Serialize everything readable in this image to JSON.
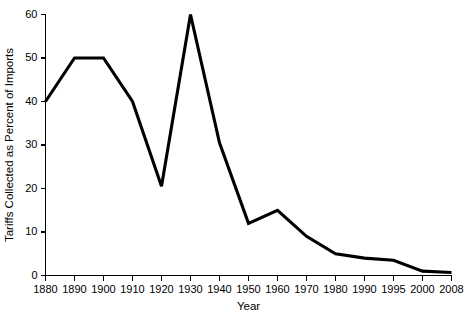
{
  "chart_data": {
    "type": "line",
    "title": "",
    "subtitle": "",
    "xlabel": "Year",
    "ylabel": "Tariffs Collected as Percent of Imports",
    "categories": [
      "1880",
      "1890",
      "1900",
      "1910",
      "1920",
      "1930",
      "1940",
      "1950",
      "1960",
      "1970",
      "1980",
      "1990",
      "1995",
      "2000",
      "2008"
    ],
    "values": [
      40,
      50,
      50,
      40,
      20.5,
      60,
      30.5,
      12,
      15,
      9,
      5,
      4,
      3.5,
      1,
      0.7
    ],
    "series": [
      {
        "name": "Tariffs Collected as Percent of Imports",
        "values": [
          40,
          50,
          50,
          40,
          20.5,
          60,
          30.5,
          12,
          15,
          9,
          5,
          4,
          3.5,
          1,
          0.7
        ],
        "color": "#000000"
      }
    ],
    "x_tick_labels": [
      "1880",
      "1890",
      "1900",
      "1910",
      "1920",
      "1930",
      "1940",
      "1950",
      "1960",
      "1970",
      "1980",
      "1990",
      "1995",
      "2000",
      "2008"
    ],
    "y_tick_labels": [
      "0",
      "10",
      "20",
      "30",
      "40",
      "50",
      "60"
    ],
    "y_ticks": [
      0,
      10,
      20,
      30,
      40,
      50,
      60
    ],
    "ylim": [
      0,
      60
    ],
    "grid": false,
    "legend": false,
    "legend_position": "none",
    "line_color": "#000000",
    "background_color": "#ffffff"
  }
}
